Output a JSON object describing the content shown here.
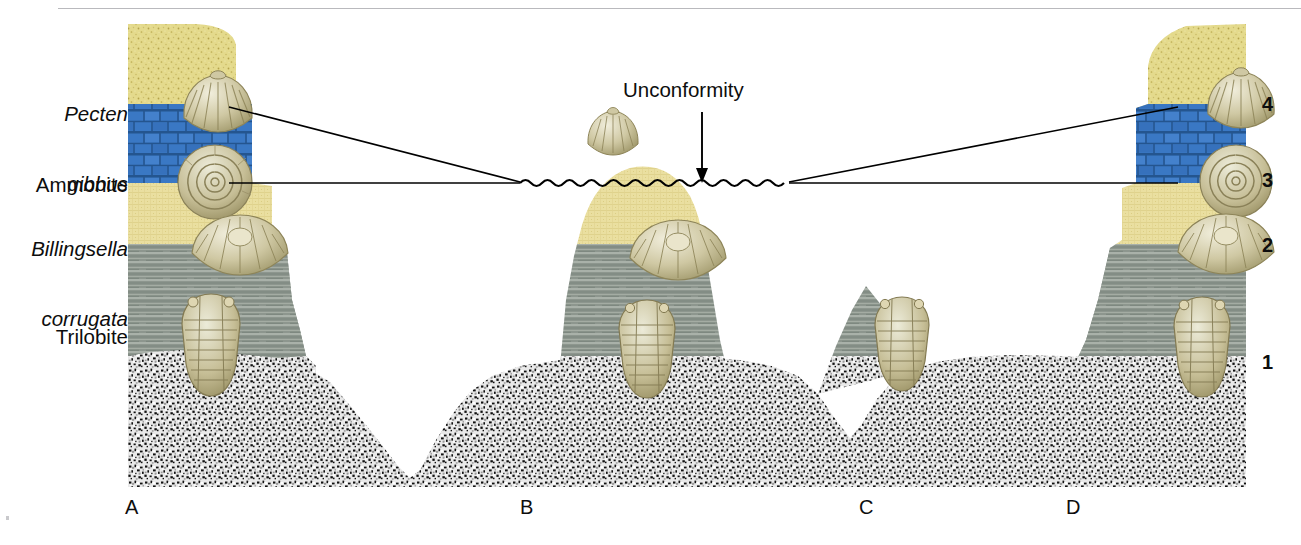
{
  "figure": {
    "title_hidden": "",
    "unconformity_label": "Unconformity",
    "side_labels": [
      {
        "id": "pecten",
        "line1": "Pecten",
        "line2": "gibbus",
        "italic": true,
        "x": 128,
        "y": 55
      },
      {
        "id": "ammonite",
        "line1": "Ammonite",
        "line2": "",
        "italic": false,
        "x": 128,
        "y": 136
      },
      {
        "id": "billingsella",
        "line1": "Billingsella",
        "line2": "corrugata",
        "italic": true,
        "x": 128,
        "y": 195
      },
      {
        "id": "trilobite",
        "line1": "Trilobite",
        "line2": "",
        "italic": false,
        "x": 128,
        "y": 288
      }
    ],
    "layer_numbers": [
      {
        "value": "4",
        "x": 1264,
        "y": 93
      },
      {
        "value": "3",
        "x": 1264,
        "y": 169
      },
      {
        "value": "2",
        "x": 1264,
        "y": 234
      },
      {
        "value": "1",
        "x": 1264,
        "y": 351
      }
    ],
    "section_letters": [
      {
        "value": "A",
        "x": 127,
        "y": 497
      },
      {
        "value": "B",
        "x": 522,
        "y": 497
      },
      {
        "value": "C",
        "x": 861,
        "y": 497
      },
      {
        "value": "D",
        "x": 1068,
        "y": 497
      }
    ],
    "colors": {
      "sandstone_top": "#e3d98a",
      "sandstone_top_dark": "#cbbd66",
      "limestone_blue": "#3b78c2",
      "limestone_blue_dark": "#2b5f9e",
      "sandstone_mid": "#ece2a6",
      "sandstone_mid_dark": "#d9cb7e",
      "shale_gray": "#8e978f",
      "shale_gray_light": "#b8bfb8",
      "granite_light": "#e8e8e8",
      "granite_dark": "#111111",
      "line": "#000000",
      "rule": "#b9b9bd"
    },
    "layers": [
      {
        "num": "1",
        "name": "granite-conglomerate",
        "pattern": "speckled"
      },
      {
        "num": "2",
        "name": "shale",
        "pattern": "horizontal-lines"
      },
      {
        "num": "3",
        "name": "sandstone-lower",
        "pattern": "fine-grain"
      },
      {
        "num": "4",
        "name": "limestone",
        "pattern": "brick"
      },
      {
        "num": "5",
        "name": "sandstone-upper",
        "pattern": "coarse-grain"
      }
    ],
    "fossils": [
      {
        "id": "pecten-left",
        "type": "scallop",
        "x": 184,
        "y": 78,
        "w": 86,
        "h": 64
      },
      {
        "id": "ammonite-left",
        "type": "ammonite",
        "x": 178,
        "y": 145,
        "w": 76,
        "h": 76
      },
      {
        "id": "billingsella-left",
        "type": "brachiopod",
        "x": 192,
        "y": 219,
        "w": 96,
        "h": 58
      },
      {
        "id": "trilobite-left",
        "type": "trilobite",
        "x": 178,
        "y": 294,
        "w": 66,
        "h": 102
      },
      {
        "id": "pecten-float",
        "type": "scallop",
        "x": 588,
        "y": 113,
        "w": 64,
        "h": 50
      },
      {
        "id": "billingsella-b",
        "type": "brachiopod",
        "x": 630,
        "y": 224,
        "w": 96,
        "h": 58
      },
      {
        "id": "trilobite-b",
        "type": "trilobite",
        "x": 616,
        "y": 300,
        "w": 62,
        "h": 98
      },
      {
        "id": "trilobite-float",
        "type": "trilobite",
        "x": 872,
        "y": 297,
        "w": 60,
        "h": 94
      },
      {
        "id": "billingsella-right",
        "type": "brachiopod",
        "x": 1178,
        "y": 218,
        "w": 96,
        "h": 58
      },
      {
        "id": "trilobite-right",
        "type": "trilobite",
        "x": 1170,
        "y": 297,
        "w": 64,
        "h": 100
      },
      {
        "id": "pecten-right",
        "type": "scallop",
        "x": 1208,
        "y": 75,
        "w": 84,
        "h": 62
      },
      {
        "id": "ammonite-right",
        "type": "ammonite",
        "x": 1200,
        "y": 145,
        "w": 74,
        "h": 74
      }
    ],
    "correlation_lines": [
      {
        "id": "left-upper",
        "from_x": 229,
        "from_y": 107,
        "to_x": 520,
        "to_y": 183
      },
      {
        "id": "left-lower",
        "from_x": 229,
        "from_y": 183,
        "to_x": 520,
        "to_y": 183
      },
      {
        "id": "right-upper",
        "from_x": 1178,
        "from_y": 107,
        "to_x": 789,
        "to_y": 183
      },
      {
        "id": "right-lower",
        "from_x": 1178,
        "from_y": 183,
        "to_x": 789,
        "to_y": 183
      }
    ],
    "unconformity_line": {
      "start_x": 520,
      "end_x": 789,
      "y": 183,
      "wave_amplitude": 5,
      "wave_period": 22
    },
    "unconformity_arrow": {
      "x": 702,
      "tail_y": 118,
      "head_y": 181,
      "label_x": 624,
      "label_y": 89
    }
  }
}
